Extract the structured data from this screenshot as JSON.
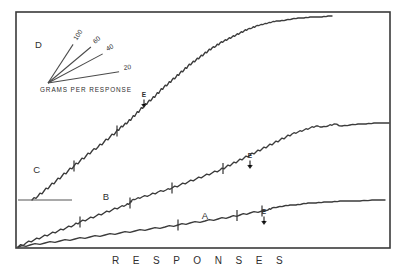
{
  "figure": {
    "background_color": "#ffffff",
    "ink_color": "#3b3b3b",
    "frame_color": "#3a3a3a",
    "axis_title": "R E S P O N S E S",
    "frame": {
      "x": 16,
      "y": 12,
      "width": 374,
      "height": 236
    }
  },
  "legend": {
    "panel_label": "D",
    "caption": "GRAMS PER RESPONSE",
    "origin": {
      "x": 48,
      "y": 83
    },
    "slopes": [
      {
        "label": "100",
        "angle_deg": -57,
        "length": 46,
        "label_rotate": -57
      },
      {
        "label": "60",
        "angle_deg": -40,
        "length": 56,
        "label_rotate": -40
      },
      {
        "label": "40",
        "angle_deg": -28,
        "length": 62,
        "label_rotate": -28
      },
      {
        "label": "20",
        "angle_deg": -9,
        "length": 72,
        "label_rotate": -9
      }
    ]
  },
  "chart_data": {
    "type": "line",
    "title": "",
    "subtitle": "",
    "xlabel": "RESPONSES",
    "ylabel": "",
    "grid": false,
    "legend_position": "inset-top-left",
    "axis_note": "Cumulative response records; y axis unlabeled (cumulative responses), x axis is time/responses",
    "xlim": [
      0,
      374
    ],
    "ylim": [
      0,
      236
    ],
    "annotations": [
      {
        "text": "E",
        "curve": "C",
        "x": 144,
        "y": 97,
        "note": "extinction / event marker with downward arrow"
      },
      {
        "text": "E",
        "curve": "B",
        "x": 250,
        "y": 158,
        "note": "extinction / event marker with downward arrow"
      },
      {
        "text": "E",
        "curve": "A",
        "x": 264,
        "y": 214,
        "note": "extinction / event marker with downward arrow"
      }
    ],
    "series": [
      {
        "name": "A",
        "label": "A",
        "label_pos": {
          "x": 205,
          "y": 219
        },
        "hatch_marks_x": [
          178,
          237,
          262
        ],
        "end_label": "",
        "points": [
          [
            18,
            247
          ],
          [
            30,
            245
          ],
          [
            45,
            243
          ],
          [
            60,
            241
          ],
          [
            75,
            239
          ],
          [
            90,
            237
          ],
          [
            105,
            235
          ],
          [
            120,
            233
          ],
          [
            135,
            231
          ],
          [
            150,
            229
          ],
          [
            165,
            227
          ],
          [
            178,
            225
          ],
          [
            190,
            223
          ],
          [
            205,
            221
          ],
          [
            218,
            219
          ],
          [
            230,
            217
          ],
          [
            240,
            215
          ],
          [
            250,
            213
          ],
          [
            262,
            211
          ],
          [
            268,
            210
          ],
          [
            272,
            208
          ],
          [
            278,
            207
          ],
          [
            284,
            206
          ],
          [
            290,
            205
          ],
          [
            296,
            205
          ],
          [
            302,
            204
          ],
          [
            308,
            203
          ],
          [
            316,
            203
          ],
          [
            324,
            202
          ],
          [
            332,
            202
          ],
          [
            340,
            201
          ],
          [
            350,
            201
          ],
          [
            360,
            201
          ],
          [
            372,
            200
          ],
          [
            385,
            200
          ]
        ]
      },
      {
        "name": "B",
        "label": "B",
        "label_pos": {
          "x": 106,
          "y": 200
        },
        "hatch_marks_x": [
          80,
          130,
          172,
          223
        ],
        "end_label": "",
        "points": [
          [
            18,
            247
          ],
          [
            26,
            243
          ],
          [
            34,
            240
          ],
          [
            42,
            237
          ],
          [
            50,
            234
          ],
          [
            58,
            231
          ],
          [
            66,
            228
          ],
          [
            74,
            225
          ],
          [
            80,
            222
          ],
          [
            88,
            219
          ],
          [
            96,
            216
          ],
          [
            104,
            213
          ],
          [
            112,
            210
          ],
          [
            120,
            207
          ],
          [
            126,
            205
          ],
          [
            130,
            203
          ],
          [
            132,
            200
          ],
          [
            136,
            199
          ],
          [
            142,
            197
          ],
          [
            150,
            195
          ],
          [
            158,
            192
          ],
          [
            166,
            190
          ],
          [
            172,
            188
          ],
          [
            180,
            185
          ],
          [
            188,
            182
          ],
          [
            196,
            179
          ],
          [
            204,
            176
          ],
          [
            212,
            173
          ],
          [
            220,
            170
          ],
          [
            226,
            167
          ],
          [
            232,
            164
          ],
          [
            238,
            161
          ],
          [
            244,
            158
          ],
          [
            250,
            155
          ],
          [
            256,
            152
          ],
          [
            262,
            149
          ],
          [
            268,
            146
          ],
          [
            274,
            143
          ],
          [
            280,
            140
          ],
          [
            286,
            137
          ],
          [
            292,
            134
          ],
          [
            298,
            132
          ],
          [
            304,
            130
          ],
          [
            310,
            128
          ],
          [
            316,
            126
          ],
          [
            322,
            127
          ],
          [
            328,
            126
          ],
          [
            334,
            124
          ],
          [
            342,
            126
          ],
          [
            350,
            125
          ],
          [
            358,
            124
          ],
          [
            366,
            124
          ],
          [
            374,
            123
          ],
          [
            382,
            123
          ],
          [
            389,
            123
          ]
        ]
      },
      {
        "name": "C",
        "label": "C",
        "label_pos": {
          "x": 37,
          "y": 173
        },
        "hatch_marks_x": [
          74,
          117
        ],
        "baseline_ref": {
          "x1": 18,
          "x2": 72,
          "y": 200
        },
        "end_label": "",
        "points": [
          [
            32,
            200
          ],
          [
            38,
            196
          ],
          [
            44,
            191
          ],
          [
            50,
            186
          ],
          [
            56,
            181
          ],
          [
            62,
            176
          ],
          [
            68,
            171
          ],
          [
            74,
            166
          ],
          [
            80,
            161
          ],
          [
            86,
            156
          ],
          [
            92,
            151
          ],
          [
            98,
            147
          ],
          [
            104,
            142
          ],
          [
            110,
            137
          ],
          [
            116,
            132
          ],
          [
            120,
            128
          ],
          [
            124,
            125
          ],
          [
            128,
            122
          ],
          [
            132,
            118
          ],
          [
            136,
            114
          ],
          [
            140,
            110
          ],
          [
            144,
            106
          ],
          [
            148,
            102
          ],
          [
            152,
            99
          ],
          [
            156,
            95
          ],
          [
            160,
            91
          ],
          [
            164,
            87
          ],
          [
            168,
            84
          ],
          [
            172,
            80
          ],
          [
            176,
            77
          ],
          [
            180,
            73
          ],
          [
            184,
            70
          ],
          [
            188,
            66
          ],
          [
            192,
            63
          ],
          [
            196,
            60
          ],
          [
            200,
            57
          ],
          [
            204,
            54
          ],
          [
            208,
            51
          ],
          [
            212,
            48
          ],
          [
            216,
            46
          ],
          [
            220,
            43
          ],
          [
            224,
            41
          ],
          [
            228,
            39
          ],
          [
            232,
            37
          ],
          [
            236,
            35
          ],
          [
            240,
            33
          ],
          [
            244,
            31
          ],
          [
            248,
            29
          ],
          [
            252,
            28
          ],
          [
            256,
            26
          ],
          [
            260,
            25
          ],
          [
            264,
            24
          ],
          [
            268,
            23
          ],
          [
            272,
            22
          ],
          [
            276,
            21
          ],
          [
            280,
            21
          ],
          [
            286,
            20
          ],
          [
            292,
            19
          ],
          [
            298,
            18
          ],
          [
            304,
            18
          ],
          [
            310,
            17
          ],
          [
            316,
            17
          ],
          [
            322,
            17
          ],
          [
            328,
            16
          ],
          [
            332,
            16
          ]
        ]
      }
    ]
  }
}
